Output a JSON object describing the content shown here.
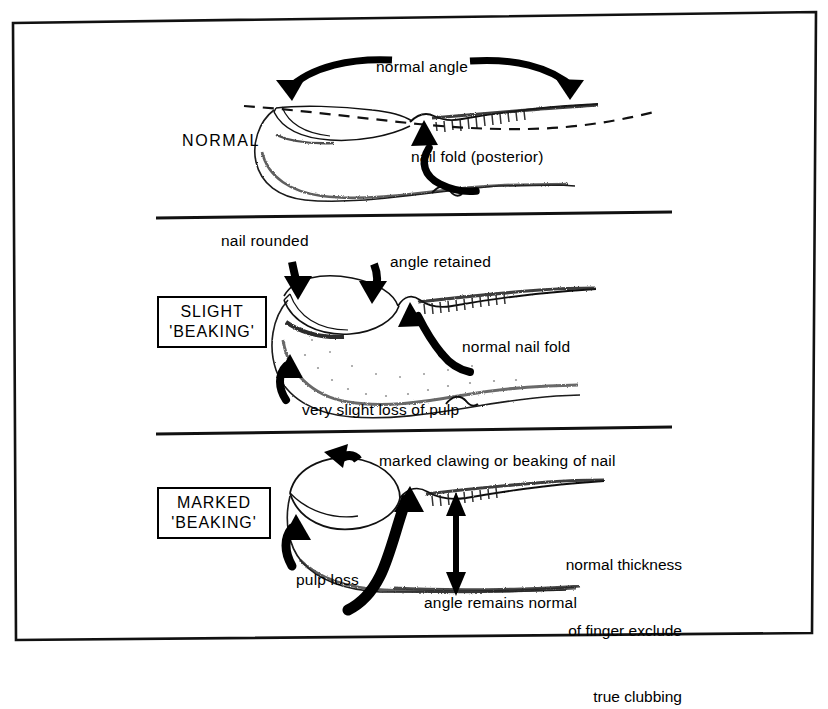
{
  "figure": {
    "background_color": "#ffffff",
    "ink_color": "#000000",
    "panel_count": 3
  },
  "panels": [
    {
      "id": "normal",
      "tag": "NORMAL",
      "tag_style": "plain",
      "labels": {
        "top_arc": "normal angle",
        "nail_fold": "nail fold (posterior)"
      }
    },
    {
      "id": "slight-beaking",
      "tag_line1": "SLIGHT",
      "tag_line2": "'BEAKING'",
      "tag_style": "boxed",
      "labels": {
        "nail_rounded": "nail rounded",
        "angle_retained": "angle retained",
        "normal_nail_fold": "normal nail fold",
        "pulp_loss": "very slight loss of pulp"
      }
    },
    {
      "id": "marked-beaking",
      "tag_line1": "MARKED",
      "tag_line2": "'BEAKING'",
      "tag_style": "boxed",
      "labels": {
        "clawing": "marked clawing or beaking of nail",
        "thickness_line1": "normal thickness",
        "thickness_line2": "of finger exclude",
        "thickness_line3": "true clubbing",
        "pulp_loss": "pulp loss",
        "angle_normal": "angle remains normal"
      }
    }
  ]
}
